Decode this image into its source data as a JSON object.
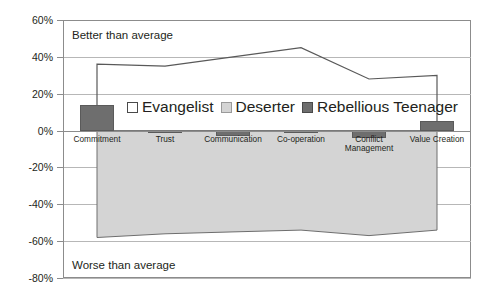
{
  "chart_data": {
    "type": "line",
    "title": "",
    "subtitle": "",
    "xlabel": "",
    "ylabel": "",
    "ylim": [
      -80,
      60
    ],
    "ytick_labels": [
      "60%",
      "40%",
      "20%",
      "0%",
      "-20%",
      "-40%",
      "-60%",
      "-80%"
    ],
    "ytick_values": [
      60,
      40,
      20,
      0,
      -20,
      -40,
      -60,
      -80
    ],
    "grid": true,
    "legend_position": "inside-upper-center",
    "categories": [
      "Commitment",
      "Trust",
      "Communication",
      "Co-operation",
      "Conflict Management",
      "Value Creation"
    ],
    "series": [
      {
        "name": "Evangelist",
        "render": "line",
        "values": [
          36,
          35,
          40,
          45,
          28,
          30
        ]
      },
      {
        "name": "Deserter",
        "render": "area",
        "values": [
          -58,
          -56,
          -55,
          -54,
          -57,
          -54
        ]
      },
      {
        "name": "Rebellious Teenager",
        "render": "bar",
        "values": [
          14,
          -1,
          -3,
          -1,
          -4,
          5
        ]
      }
    ],
    "annotations": [
      {
        "id": "better",
        "text": "Better than average"
      },
      {
        "id": "worse",
        "text": "Worse than average"
      }
    ]
  },
  "legend": {
    "items": [
      {
        "label": "Evangelist",
        "swatch": "open-square-icon",
        "color": "#ffffff"
      },
      {
        "label": "Deserter",
        "swatch": "light-gray-square-icon",
        "color": "#d4d4d4"
      },
      {
        "label": "Rebellious Teenager",
        "swatch": "dark-gray-square-icon",
        "color": "#6e6e6e"
      }
    ]
  },
  "axis": {
    "y_labels": [
      "60%",
      "40%",
      "20%",
      "0%",
      "-20%",
      "-40%",
      "-60%",
      "-80%"
    ]
  },
  "categories": {
    "labels": [
      {
        "line1": "Commitment",
        "line2": ""
      },
      {
        "line1": "Trust",
        "line2": ""
      },
      {
        "line1": "Communication",
        "line2": ""
      },
      {
        "line1": "Co-operation",
        "line2": ""
      },
      {
        "line1": "Conflict",
        "line2": "Management"
      },
      {
        "line1": "Value Creation",
        "line2": ""
      }
    ]
  },
  "notes": {
    "better": "Better than average",
    "worse": "Worse than average"
  },
  "colors": {
    "evangelist_line": "#595959",
    "deserter_fill": "#d4d4d4",
    "deserter_edge": "#6e6e6e",
    "rebel_bar": "#6e6e6e",
    "grid": "#b7b7b7",
    "axis": "#8c8c8c",
    "text": "#231f20"
  }
}
